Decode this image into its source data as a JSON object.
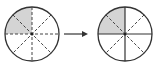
{
  "diagram": {
    "left_circle": {
      "parts": 8,
      "shaded": 2,
      "line_style": "dashed"
    },
    "arrow": {
      "direction": "right"
    },
    "right_circle": {
      "parts": 4,
      "shaded": 1,
      "line_style": "solid quarters with dashed diagonals"
    },
    "colors": {
      "shade": "#d4d4d4",
      "stroke": "#333333",
      "background": "#ffffff"
    }
  }
}
